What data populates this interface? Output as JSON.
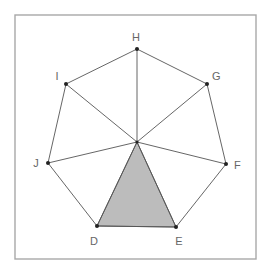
{
  "diagram": {
    "type": "regular heptagon with spokes from center, one shaded triangle",
    "frame": {
      "x": 15,
      "y": 15,
      "width": 241,
      "height": 244,
      "color": "#a8a8a8"
    },
    "center": {
      "x": 137,
      "y": 142
    },
    "vertices": [
      {
        "name": "H",
        "x": 137,
        "y": 49,
        "label_x": 136,
        "label_y": 41,
        "anchor": "middle"
      },
      {
        "name": "G",
        "x": 207,
        "y": 84,
        "label_x": 212,
        "label_y": 80,
        "anchor": "start"
      },
      {
        "name": "F",
        "x": 226,
        "y": 164,
        "label_x": 234,
        "label_y": 169,
        "anchor": "start"
      },
      {
        "name": "E",
        "x": 176,
        "y": 227,
        "label_x": 179,
        "label_y": 245,
        "anchor": "middle"
      },
      {
        "name": "D",
        "x": 97,
        "y": 226,
        "label_x": 94,
        "label_y": 245,
        "anchor": "middle"
      },
      {
        "name": "J",
        "x": 48,
        "y": 163,
        "label_x": 36,
        "label_y": 167,
        "anchor": "middle"
      },
      {
        "name": "I",
        "x": 66,
        "y": 84,
        "label_x": 57,
        "label_y": 80,
        "anchor": "middle"
      }
    ],
    "shaded_triangle": {
      "vertices": [
        "center",
        "D",
        "E"
      ],
      "fill": "#bcbcbc"
    },
    "colors": {
      "line": "#555555",
      "point": "#222222",
      "label": "#666666"
    }
  }
}
